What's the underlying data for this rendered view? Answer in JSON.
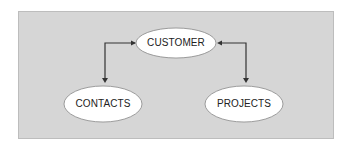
{
  "diagram": {
    "type": "entity-relationship",
    "nodes": [
      {
        "id": "customer",
        "label": "CUSTOMER"
      },
      {
        "id": "contacts",
        "label": "CONTACTS"
      },
      {
        "id": "projects",
        "label": "PROJECTS"
      }
    ],
    "edges": [
      {
        "from": "customer",
        "to": "contacts",
        "style": "bidirectional-elbow"
      },
      {
        "from": "customer",
        "to": "projects",
        "style": "bidirectional-elbow"
      }
    ]
  },
  "colors": {
    "panel": "#d6d6d6",
    "node_fill": "#ffffff",
    "line": "#333333"
  }
}
